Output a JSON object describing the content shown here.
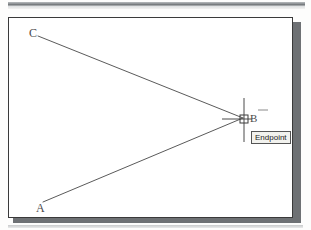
{
  "app": {
    "window_title": "",
    "background_color": "#fdfdfc",
    "panel_color": "#ffffff",
    "panel_border_color": "#3a3a3a",
    "shadow_color": "#6e7174",
    "geometry_color": "#5a5a5a"
  },
  "drawing": {
    "labels": {
      "a": "A",
      "b": "B",
      "c": "C"
    },
    "points": {
      "a": {
        "x": 43,
        "y": 202
      },
      "b": {
        "x": 243,
        "y": 118
      },
      "c": {
        "x": 38,
        "y": 36
      }
    },
    "lines": [
      {
        "name": "line-c-b",
        "from": "c",
        "to": "b"
      },
      {
        "name": "line-a-b",
        "from": "a",
        "to": "b"
      }
    ]
  },
  "cursor": {
    "type": "crosshair",
    "center": {
      "x": 244,
      "y": 119
    },
    "vertical_top": 98,
    "vertical_bottom": 142,
    "horizontal_left": 222,
    "horizontal_right": 252,
    "snap_marker": {
      "type": "endpoint-square",
      "x": 240,
      "y": 115,
      "size": 8
    }
  },
  "tooltip": {
    "label": "Endpoint",
    "background": "#f2f2ee",
    "border": "#555555"
  },
  "chrome": {
    "top_band_present": true,
    "bottom_edge_present": true
  }
}
